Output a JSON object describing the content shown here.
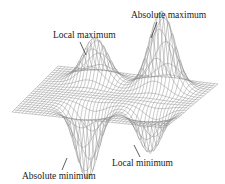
{
  "figure": {
    "type": "3D surface plot with extrema labels",
    "labels": {
      "absolute_maximum": "Absolute maximum",
      "local_maximum": "Local maximum",
      "local_minimum": "Local minimum",
      "absolute_minimum": "Absolute minimum"
    },
    "colors": {
      "mesh": "#8a8a8a",
      "text": "#1a1a1a",
      "background": "#ffffff"
    }
  }
}
